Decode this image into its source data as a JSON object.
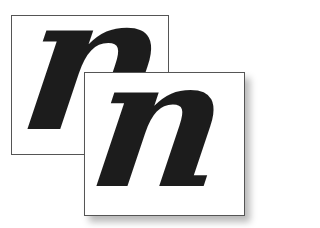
{
  "figure": {
    "back_panel": {
      "letter": "n"
    },
    "front_panel": {
      "letter": "n"
    }
  },
  "colors": {
    "background": "#ffffff",
    "border": "#555555",
    "glyph": "#1c1c1c"
  }
}
